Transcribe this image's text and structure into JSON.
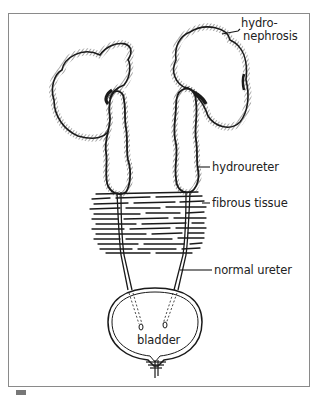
{
  "figure": {
    "type": "anatomical illustration"
  },
  "labels": {
    "hydronephrosis_line1": "hydro-",
    "hydronephrosis_line2": "nephrosis",
    "hydroureter": "hydroureter",
    "fibrous_tissue": "fibrous tissue",
    "normal_ureter": "normal ureter",
    "bladder": "bladder"
  },
  "colors": {
    "ink": "#1a1a1a",
    "frame": "#8a8a8a",
    "background": "#ffffff"
  }
}
